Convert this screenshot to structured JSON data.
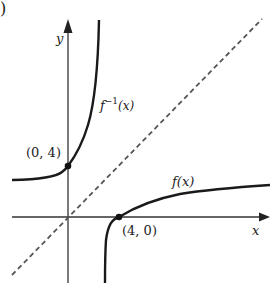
{
  "figure": {
    "panel_marker": ")",
    "axes": {
      "x_label": "x",
      "y_label": "y"
    },
    "curves": [
      {
        "name": "f(x)",
        "label": "f(x)",
        "style": "solid",
        "color": "#1a1a1a"
      },
      {
        "name": "f_inverse",
        "label_base": "f",
        "label_sup": "−1",
        "label_arg": "(x)",
        "style": "solid",
        "color": "#1a1a1a"
      },
      {
        "name": "y=x",
        "label": "",
        "style": "dashed",
        "color": "#555555"
      }
    ],
    "points": [
      {
        "label": "(0, 4)",
        "x": 0,
        "y": 4
      },
      {
        "label": "(4, 0)",
        "x": 4,
        "y": 0
      }
    ]
  },
  "colors": {
    "axis": "#333333",
    "curve": "#1a1a1a",
    "dashed": "#555555",
    "background": "#ffffff"
  }
}
